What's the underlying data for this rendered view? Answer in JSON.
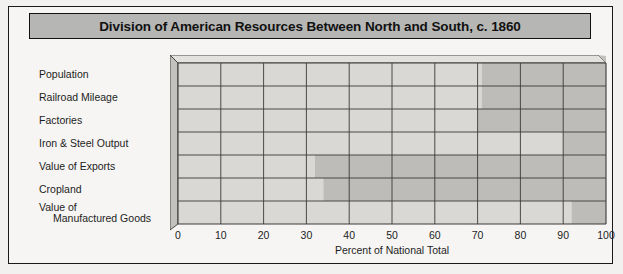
{
  "figure": {
    "title": "Division of American Resources Between North and South, c. 1860",
    "title_bg": "#b6b6b4",
    "border_color": "#111111",
    "background": "#f6f5f3"
  },
  "axis": {
    "xlabel": "Percent of National Total",
    "ticks": [
      "0",
      "10",
      "20",
      "30",
      "40",
      "50",
      "60",
      "70",
      "80",
      "90",
      "100"
    ]
  },
  "colors": {
    "north_fill": "#d9d8d4",
    "south_fill": "#bdbcb8",
    "grid_line": "#3a3a3a",
    "side_face": "#c2c1bd",
    "top_face": "#e3e2de"
  },
  "rows": [
    {
      "label": "Population",
      "label_line2": "",
      "north": 71,
      "south": 29
    },
    {
      "label": "Railroad Mileage",
      "label_line2": "",
      "north": 71,
      "south": 29
    },
    {
      "label": "Factories",
      "label_line2": "",
      "north": 70,
      "south": 30
    },
    {
      "label": "Iron & Steel Output",
      "label_line2": "",
      "north": 90,
      "south": 10
    },
    {
      "label": "Value of Exports",
      "label_line2": "",
      "north": 32,
      "south": 68
    },
    {
      "label": "Cropland",
      "label_line2": "",
      "north": 34,
      "south": 66
    },
    {
      "label": "Value of",
      "label_line2": "Manufactured Goods",
      "north": 92,
      "south": 8
    }
  ],
  "chart_data": {
    "type": "bar",
    "orientation": "horizontal",
    "stacked": true,
    "title": "Division of American Resources Between North and South, c. 1860",
    "xlabel": "Percent of National Total",
    "ylabel": "",
    "xlim": [
      0,
      100
    ],
    "xticks": [
      0,
      10,
      20,
      30,
      40,
      50,
      60,
      70,
      80,
      90,
      100
    ],
    "grid": true,
    "legend": "none",
    "categories": [
      "Population",
      "Railroad Mileage",
      "Factories",
      "Iron & Steel Output",
      "Value of Exports",
      "Cropland",
      "Value of Manufactured Goods"
    ],
    "series": [
      {
        "name": "North",
        "color": "#d9d8d4",
        "values": [
          71,
          71,
          70,
          90,
          32,
          34,
          92
        ]
      },
      {
        "name": "South",
        "color": "#bdbcb8",
        "values": [
          29,
          29,
          30,
          10,
          68,
          66,
          8
        ]
      }
    ]
  }
}
